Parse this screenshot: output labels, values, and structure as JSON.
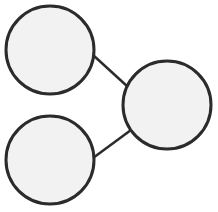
{
  "diagram": {
    "type": "node-link",
    "colors": {
      "background": "#ffffff",
      "node_fill": "#f2f2f2",
      "stroke": "#2b2b2b"
    },
    "nodes": [
      {
        "id": "top-left",
        "cx": 50,
        "cy": 50,
        "r": 44,
        "label": ""
      },
      {
        "id": "right",
        "cx": 167,
        "cy": 105,
        "r": 44,
        "label": ""
      },
      {
        "id": "bottom-left",
        "cx": 50,
        "cy": 160,
        "r": 44,
        "label": ""
      }
    ],
    "edges": [
      {
        "from": "top-left",
        "to": "right",
        "x1": 93,
        "y1": 55,
        "x2": 128,
        "y2": 87
      },
      {
        "from": "bottom-left",
        "to": "right",
        "x1": 93,
        "y1": 158,
        "x2": 131,
        "y2": 130
      }
    ]
  }
}
